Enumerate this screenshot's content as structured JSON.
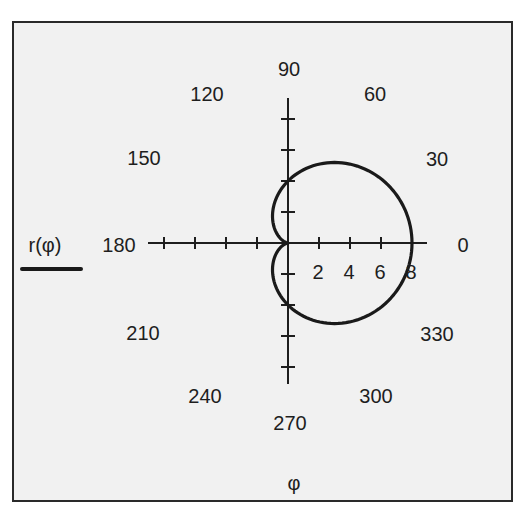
{
  "chart_data": {
    "type": "line",
    "subtype": "polar",
    "title": "",
    "xlabel": "φ",
    "ylabel": "r(φ)",
    "legend": [
      {
        "label": "r(φ)",
        "style": "solid black line",
        "position": "left"
      }
    ],
    "angular_ticks": [
      "0",
      "30",
      "60",
      "90",
      "120",
      "150",
      "180",
      "210",
      "240",
      "270",
      "300",
      "330"
    ],
    "radial_ticks": [
      "2",
      "4",
      "6",
      "8"
    ],
    "radial_range": [
      0,
      9
    ],
    "grid": false,
    "series": [
      {
        "name": "r(φ)",
        "formula": "r = 4 + 4·cos(φ)",
        "phi_deg": [
          0,
          30,
          60,
          90,
          120,
          150,
          180,
          210,
          240,
          270,
          300,
          330,
          360
        ],
        "r": [
          8,
          7.46,
          6,
          4,
          2,
          0.54,
          0,
          0.54,
          2,
          4,
          6,
          7.46,
          8
        ]
      }
    ]
  },
  "labels": {
    "legend_text": "r(φ)",
    "x_axis_label": "φ",
    "angles": {
      "a0": "0",
      "a30": "30",
      "a60": "60",
      "a90": "90",
      "a120": "120",
      "a150": "150",
      "a180": "180",
      "a210": "210",
      "a240": "240",
      "a270": "270",
      "a300": "300",
      "a330": "330"
    },
    "radial": {
      "r2": "2",
      "r4": "4",
      "r6": "6",
      "r8": "8"
    }
  },
  "colors": {
    "background": "#f1f1f1",
    "line": "#1a1a1a",
    "frame": "#2a2a2a"
  }
}
